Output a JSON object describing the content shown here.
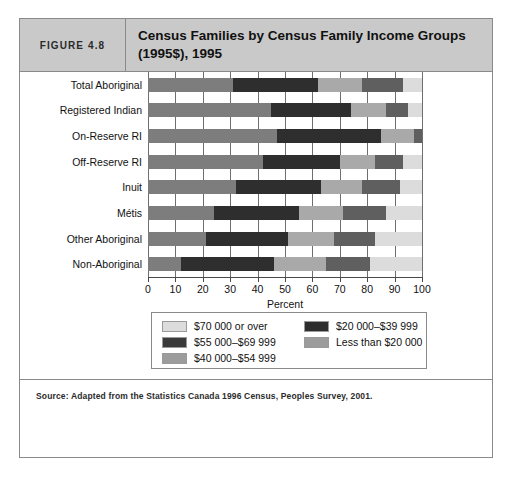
{
  "figure": {
    "number_label": "FIGURE 4.8",
    "title": "Census Families by Census Family Income Groups (1995$), 1995",
    "source_note": "Source: Adapted from the Statistics Canada 1996 Census, Peoples Survey, 2001."
  },
  "chart_data": {
    "type": "bar",
    "orientation": "horizontal",
    "stacked": true,
    "title": "Census Families by Census Family Income Groups (1995$), 1995",
    "xlabel": "Percent",
    "ylabel": "",
    "xlim": [
      0,
      100
    ],
    "xticks": [
      0,
      10,
      20,
      30,
      40,
      50,
      60,
      70,
      80,
      90,
      100
    ],
    "xtick_labels": [
      "0",
      "10",
      "20",
      "30",
      "40",
      "50",
      "60",
      "70",
      "80",
      "90",
      "100"
    ],
    "grid": true,
    "legend_position": "bottom",
    "categories": [
      "Total Aboriginal",
      "Registered Indian",
      "On-Reserve RI",
      "Off-Reserve RI",
      "Inuit",
      "Métis",
      "Other Aboriginal",
      "Non-Aboriginal"
    ],
    "series": [
      {
        "name": "Less than $20 000",
        "color": "#7d7d7d",
        "values": [
          31,
          45,
          47,
          42,
          32,
          24,
          21,
          12
        ]
      },
      {
        "name": "$20 000–$39 999",
        "color": "#2e2e2e",
        "values": [
          31,
          29,
          38,
          28,
          31,
          31,
          30,
          34
        ]
      },
      {
        "name": "$40 000–$54 999",
        "color": "#a9a9a9",
        "values": [
          16,
          13,
          12,
          13,
          15,
          16,
          17,
          19
        ]
      },
      {
        "name": "$55 000–$69 999",
        "color": "#5f5f5f",
        "values": [
          15,
          8,
          3,
          10,
          14,
          16,
          15,
          16
        ]
      },
      {
        "name": "$70 000 or over",
        "color": "#dcdcdc",
        "values": [
          7,
          5,
          0,
          7,
          8,
          13,
          17,
          19
        ]
      }
    ],
    "legend": [
      {
        "label": "$70 000 or over",
        "color": "#dcdcdc"
      },
      {
        "label": "$55 000–$69 999",
        "color": "#3a3a3a"
      },
      {
        "label": "$40 000–$54 999",
        "color": "#9c9c9c"
      },
      {
        "label": "$20 000–$39 999",
        "color": "#2e2e2e"
      },
      {
        "label": "Less than $20 000",
        "color": "#9c9c9c"
      }
    ]
  },
  "colors": {
    "header_bg": "#c9c9c9",
    "border": "#8a8a8a",
    "axis": "#4a4a4a"
  }
}
